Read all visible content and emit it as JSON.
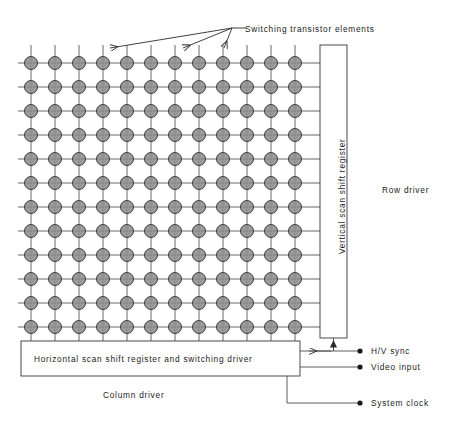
{
  "diagram": {
    "title_annotation": "Switching transistor elements",
    "matrix": {
      "rows": 12,
      "columns": 12,
      "cell_pitch": 24,
      "element_radius": 6.5,
      "origin_x": 31,
      "origin_y": 63,
      "element_fill": "#8c8c8c",
      "element_stroke": "#3d3d3d",
      "line_color": "#555555"
    },
    "blocks": [
      {
        "name": "vertical-scan-shift-register",
        "label": "Vertical scan shift register",
        "orientation": "vertical",
        "x": 320,
        "y": 45,
        "width": 27,
        "height": 293
      },
      {
        "name": "horizontal-scan-shift-register",
        "label": "Horizontal scan shift register and switching driver",
        "orientation": "horizontal",
        "x": 21,
        "y": 341,
        "width": 279,
        "height": 35
      }
    ],
    "captions": [
      {
        "name": "row-driver-caption",
        "label": "Row driver",
        "x": 382,
        "y": 186
      },
      {
        "name": "column-driver-caption",
        "label": "Column driver",
        "x": 103,
        "y": 391
      }
    ],
    "terminals": [
      {
        "name": "hv-sync-terminal",
        "label": "H/V sync",
        "dot_x": 360,
        "dot_y": 351
      },
      {
        "name": "video-input-terminal",
        "label": "Video input",
        "dot_x": 360,
        "dot_y": 367
      },
      {
        "name": "system-clock-terminal",
        "label": "System clock",
        "dot_x": 360,
        "dot_y": 403
      }
    ],
    "leader_lines": {
      "name": "switching-transistor-leaders",
      "hub_x": 232,
      "hub_y": 28,
      "targets": [
        {
          "x": 110,
          "y": 48
        },
        {
          "x": 183,
          "y": 48
        },
        {
          "x": 224,
          "y": 48
        }
      ],
      "label_x": 245,
      "label_y": 25
    },
    "colors": {
      "stroke": "#4a4a4a",
      "element_fill": "#8c8c8c",
      "text": "#1a1a1a"
    }
  }
}
